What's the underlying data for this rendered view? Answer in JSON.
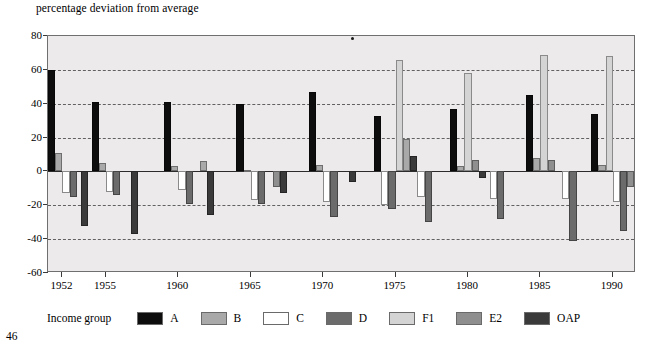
{
  "page_number": "46",
  "axis_title": "percentage deviation from average",
  "legend": {
    "title": "Income group",
    "items": [
      {
        "label": "A",
        "color": "#0d0d0d"
      },
      {
        "label": "B",
        "color": "#a9a9a9"
      },
      {
        "label": "C",
        "color": "#ffffff"
      },
      {
        "label": "D",
        "color": "#6b6b6b"
      },
      {
        "label": "F1",
        "color": "#d4d4d4"
      },
      {
        "label": "E2",
        "color": "#8f8f8f"
      },
      {
        "label": "OAP",
        "color": "#3a3a3a"
      }
    ]
  },
  "chart_data": {
    "type": "bar",
    "title": "",
    "subtitle": "",
    "xlabel": "",
    "ylabel": "percentage deviation from average",
    "ylim": [
      -60,
      80
    ],
    "yticks": [
      80,
      60,
      40,
      20,
      0,
      -20,
      -40,
      -60
    ],
    "grid": true,
    "legend_position": "bottom",
    "x": [
      1952,
      1955,
      1960,
      1965,
      1970,
      1975,
      1980,
      1985,
      1990
    ],
    "xticks": [
      "1952",
      "1955",
      "1960",
      "1965",
      "1970",
      "1975",
      "1980",
      "1985",
      "1990"
    ],
    "x_positions": [
      1952,
      1953.5,
      1955,
      1957,
      1960,
      1962,
      1965,
      1967,
      1970,
      1972,
      1975,
      1977,
      1980,
      1982,
      1985,
      1987,
      1990
    ],
    "groups": [
      {
        "year": "1952",
        "bars": [
          {
            "series": "A",
            "value": 60
          },
          {
            "series": "B",
            "value": 11
          },
          {
            "series": "C",
            "value": -13
          },
          {
            "series": "D",
            "value": -15
          }
        ]
      },
      {
        "year": "1953",
        "bars": [
          {
            "series": "OAP",
            "value": -32
          }
        ]
      },
      {
        "year": "1955",
        "bars": [
          {
            "series": "A",
            "value": 41
          },
          {
            "series": "B",
            "value": 5
          },
          {
            "series": "C",
            "value": -12
          },
          {
            "series": "D",
            "value": -14
          }
        ]
      },
      {
        "year": "1957",
        "bars": [
          {
            "series": "OAP",
            "value": -37
          }
        ]
      },
      {
        "year": "1960",
        "bars": [
          {
            "series": "A",
            "value": 41
          },
          {
            "series": "B",
            "value": 3
          },
          {
            "series": "C",
            "value": -11
          },
          {
            "series": "D",
            "value": -19
          }
        ]
      },
      {
        "year": "1962",
        "bars": [
          {
            "series": "B",
            "value": 6
          },
          {
            "series": "OAP",
            "value": -26
          }
        ]
      },
      {
        "year": "1965",
        "bars": [
          {
            "series": "A",
            "value": 40
          },
          {
            "series": "B",
            "value": 1
          },
          {
            "series": "C",
            "value": -17
          },
          {
            "series": "D",
            "value": -19
          }
        ]
      },
      {
        "year": "1967",
        "bars": [
          {
            "series": "E2",
            "value": -9
          },
          {
            "series": "OAP",
            "value": -13
          }
        ]
      },
      {
        "year": "1970",
        "bars": [
          {
            "series": "A",
            "value": 47
          },
          {
            "series": "B",
            "value": 4
          },
          {
            "series": "C",
            "value": -18
          },
          {
            "series": "D",
            "value": -27
          }
        ]
      },
      {
        "year": "1972",
        "bars": [
          {
            "series": "OAP",
            "value": -6
          }
        ]
      },
      {
        "year": "1975",
        "bars": [
          {
            "series": "A",
            "value": 33
          },
          {
            "series": "C",
            "value": -20
          },
          {
            "series": "D",
            "value": -22
          },
          {
            "series": "F1",
            "value": 66
          },
          {
            "series": "B",
            "value": 19
          },
          {
            "series": "OAP",
            "value": 9
          }
        ]
      },
      {
        "year": "1977",
        "bars": [
          {
            "series": "C",
            "value": -15
          },
          {
            "series": "D",
            "value": -30
          }
        ]
      },
      {
        "year": "1980",
        "bars": [
          {
            "series": "A",
            "value": 37
          },
          {
            "series": "B",
            "value": 3
          },
          {
            "series": "F1",
            "value": 58
          },
          {
            "series": "E2",
            "value": 7
          },
          {
            "series": "OAP",
            "value": -4
          }
        ]
      },
      {
        "year": "1982",
        "bars": [
          {
            "series": "C",
            "value": -16
          },
          {
            "series": "D",
            "value": -28
          }
        ]
      },
      {
        "year": "1985",
        "bars": [
          {
            "series": "A",
            "value": 45
          },
          {
            "series": "B",
            "value": 8
          },
          {
            "series": "F1",
            "value": 69
          },
          {
            "series": "E2",
            "value": 7
          }
        ]
      },
      {
        "year": "1987",
        "bars": [
          {
            "series": "C",
            "value": -16
          },
          {
            "series": "D",
            "value": -41
          }
        ]
      },
      {
        "year": "1990",
        "bars": [
          {
            "series": "A",
            "value": 34
          },
          {
            "series": "B",
            "value": 4
          },
          {
            "series": "F1",
            "value": 68
          },
          {
            "series": "C",
            "value": -18
          },
          {
            "series": "D",
            "value": -35
          },
          {
            "series": "E2",
            "value": -9
          }
        ]
      }
    ]
  }
}
